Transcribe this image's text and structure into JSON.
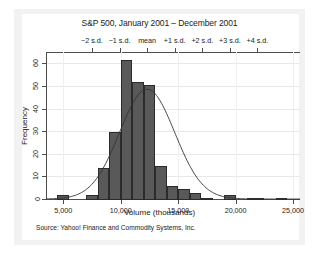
{
  "chart_data": {
    "type": "bar",
    "title": "S&P 500, January 2001 – December 2001",
    "xlabel": "Volume (thousands)",
    "ylabel": "Frequency",
    "xlim": [
      3500,
      25600
    ],
    "ylim": [
      0,
      65
    ],
    "grid": true,
    "legend": "none",
    "bin_width": 1000,
    "x_ticks": [
      5000,
      10000,
      15000,
      20000,
      25000
    ],
    "x_tick_labels": [
      "5,000",
      "10,000",
      "15,000",
      "20,000",
      "25,000"
    ],
    "y_ticks": [
      0,
      10,
      20,
      30,
      40,
      50,
      60
    ],
    "y_tick_labels": [
      "0",
      "10",
      "20",
      "30",
      "40",
      "50",
      "60"
    ],
    "bin_starts": [
      4500,
      5500,
      6500,
      7500,
      8500,
      9500,
      10500,
      11500,
      12500,
      13500,
      14500,
      15500,
      16500,
      17500,
      18500,
      19500,
      20500,
      21500,
      22500,
      23500,
      24500
    ],
    "values": [
      2,
      0,
      0,
      2,
      14,
      30,
      62,
      52,
      51,
      15,
      6,
      5,
      3,
      1,
      0,
      2,
      2,
      0,
      0,
      1,
      1
    ],
    "bars": [
      {
        "x0": 4500,
        "x1": 5500,
        "height": 2
      },
      {
        "x0": 7000,
        "x1": 8000,
        "height": 2
      },
      {
        "x0": 8000,
        "x1": 9000,
        "height": 14
      },
      {
        "x0": 9000,
        "x1": 10000,
        "height": 30
      },
      {
        "x0": 10000,
        "x1": 11000,
        "height": 62
      },
      {
        "x0": 11000,
        "x1": 12000,
        "height": 52
      },
      {
        "x0": 12000,
        "x1": 13000,
        "height": 51
      },
      {
        "x0": 13000,
        "x1": 14000,
        "height": 15
      },
      {
        "x0": 14000,
        "x1": 15000,
        "height": 6
      },
      {
        "x0": 15000,
        "x1": 16000,
        "height": 5
      },
      {
        "x0": 16000,
        "x1": 17000,
        "height": 3
      },
      {
        "x0": 17000,
        "x1": 18000,
        "height": 1
      },
      {
        "x0": 19000,
        "x1": 20000,
        "height": 2
      },
      {
        "x0": 21000,
        "x1": 22500,
        "height": 1
      },
      {
        "x0": 23500,
        "x1": 24500,
        "height": 1
      }
    ],
    "overlay_curve": {
      "name": "normal density",
      "mean": 12300,
      "sd": 2400,
      "peak_frequency": 48.5
    },
    "sd_axis": {
      "labels": [
        "−2 s.d.",
        "−1 s.d.",
        "mean",
        "+1 s.d.",
        "+2 s.d.",
        "+3 s.d.",
        "+4 s.d."
      ],
      "positions": [
        7500,
        9900,
        12300,
        14700,
        17100,
        19500,
        21900
      ]
    },
    "source_note": "Source:  Yahoo! Finance and Commodity Systems, Inc.",
    "colors": {
      "bar_fill": "#595959",
      "bar_edge": "#2b2b2b",
      "axis": "#4d4d4d",
      "grid": "#e8e8e8",
      "panel": "#f2f2f2",
      "plot_background": "#ffffff",
      "text": "#1a1a1a"
    }
  }
}
